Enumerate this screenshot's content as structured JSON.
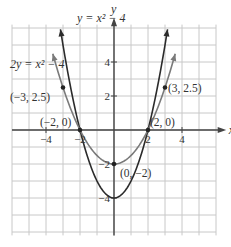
{
  "chart_data": {
    "type": "line",
    "title": "",
    "xlabel": "x",
    "ylabel": "y",
    "xlim": [
      -6,
      6
    ],
    "ylim": [
      -6,
      6
    ],
    "grid": true,
    "x_ticks": [
      {
        "value": -4,
        "label": "−4"
      },
      {
        "value": -2,
        "label": "−2"
      },
      {
        "value": 2,
        "label": "2"
      },
      {
        "value": 4,
        "label": "4"
      }
    ],
    "y_ticks": [
      {
        "value": 4,
        "label": "4"
      },
      {
        "value": 2,
        "label": "2"
      },
      {
        "value": -2,
        "label": "−2"
      },
      {
        "value": -4,
        "label": "−4"
      }
    ],
    "series": [
      {
        "name": "y = x² − 4",
        "equation": "y = x^2 - 4",
        "color": "#2b2b2b",
        "x_range": [
          -3.15,
          3.15
        ]
      },
      {
        "name": "2y = x² − 4",
        "equation": "2y = x^2 - 4",
        "color": "#7a7a7a",
        "x_range": [
          -3.6,
          3.6
        ]
      }
    ],
    "annotations": [
      {
        "text": "(−3, 2.5)",
        "x": -3,
        "y": 2.5
      },
      {
        "text": "(3, 2.5)",
        "x": 3,
        "y": 2.5
      },
      {
        "text": "(−2, 0)",
        "x": -2,
        "y": 0
      },
      {
        "text": "(2, 0)",
        "x": 2,
        "y": 0
      },
      {
        "text": "(0, −2)",
        "x": 0,
        "y": -2
      }
    ],
    "curve_labels": [
      {
        "text": "y = x² − 4",
        "series": 0
      },
      {
        "text": "2y = x² − 4",
        "series": 1
      }
    ]
  }
}
